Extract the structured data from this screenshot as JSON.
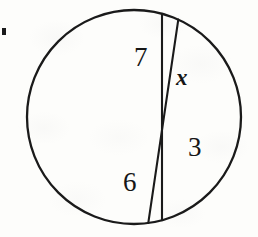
{
  "figure": {
    "background_color": "#fdfdfb",
    "ink_color": "#1a1a1a",
    "circle": {
      "center_x": 134,
      "center_y": 117,
      "radius": 107,
      "stroke_width": 2.3
    },
    "chords": [
      {
        "name": "chord-a",
        "x1": 85,
        "y1": 23,
        "x2": 85,
        "y2": 212,
        "stroke_width": 2.1,
        "segments": [
          "7",
          "6"
        ]
      },
      {
        "name": "chord-b",
        "x1": 225,
        "y1": 68,
        "x2": 207,
        "y2": 190,
        "stroke_width": 2.1,
        "segments": [
          "x",
          "3"
        ]
      }
    ],
    "intersection": {
      "x": 162,
      "y": 130
    },
    "labels": [
      {
        "id": "label-7",
        "text": "7",
        "kind": "number",
        "x": 134,
        "y": 44,
        "segment": "chord-a-upper"
      },
      {
        "id": "label-x",
        "text": "x",
        "kind": "variable",
        "x": 176,
        "y": 66,
        "segment": "chord-b-upper"
      },
      {
        "id": "label-3",
        "text": "3",
        "kind": "number",
        "x": 188,
        "y": 134,
        "segment": "chord-b-lower"
      },
      {
        "id": "label-6",
        "text": "6",
        "kind": "number",
        "x": 123,
        "y": 169,
        "segment": "chord-a-lower"
      }
    ],
    "margin_mark": {
      "present": true,
      "description": "small black bullet fragment cropped at left page edge"
    }
  }
}
